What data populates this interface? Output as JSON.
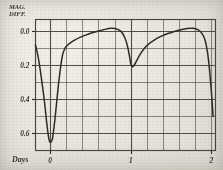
{
  "figure": {
    "kind": "scanned-light-curve-plot",
    "ylabel_line1": "MAG.",
    "ylabel_line2": "DIFF.",
    "xlabel": "Days",
    "ink_color": "#2e2b25",
    "grid_color": "#4a463e",
    "paper_color": "#e9e7e1"
  },
  "chart_data": {
    "type": "line",
    "title": "",
    "xlabel": "Days",
    "ylabel": "MAG. DIFF.",
    "xlim": [
      -0.18,
      2.05
    ],
    "ylim": [
      0.7,
      -0.07
    ],
    "y_inverted": true,
    "grid": true,
    "legend": null,
    "xticks": [
      0,
      1,
      2
    ],
    "xticklabels": [
      "0",
      "1",
      "2"
    ],
    "yticks": [
      0.0,
      0.2,
      0.4,
      0.6
    ],
    "yticklabels": [
      "0.0",
      "0.2",
      "0.4",
      "0.6"
    ],
    "x_minor_step": 0.2,
    "y_minor_step": 0.1,
    "series": [
      {
        "name": "magnitude difference",
        "x": [
          -0.18,
          -0.16,
          -0.14,
          -0.12,
          -0.1,
          -0.08,
          -0.06,
          -0.045,
          -0.03,
          -0.015,
          0.0,
          0.015,
          0.03,
          0.045,
          0.06,
          0.075,
          0.09,
          0.105,
          0.12,
          0.14,
          0.16,
          0.19,
          0.22,
          0.26,
          0.31,
          0.37,
          0.44,
          0.52,
          0.6,
          0.68,
          0.75,
          0.82,
          0.88,
          0.92,
          0.95,
          0.97,
          0.99,
          1.0,
          1.02,
          1.04,
          1.07,
          1.11,
          1.16,
          1.22,
          1.3,
          1.38,
          1.46,
          1.54,
          1.62,
          1.7,
          1.77,
          1.83,
          1.88,
          1.92,
          1.95,
          1.975,
          2.0,
          2.02
        ],
        "y": [
          0.08,
          0.12,
          0.17,
          0.23,
          0.3,
          0.37,
          0.45,
          0.52,
          0.58,
          0.63,
          0.652,
          0.648,
          0.63,
          0.58,
          0.52,
          0.45,
          0.38,
          0.31,
          0.25,
          0.18,
          0.13,
          0.095,
          0.08,
          0.065,
          0.05,
          0.035,
          0.022,
          0.008,
          -0.003,
          -0.012,
          -0.018,
          -0.016,
          0.0,
          0.03,
          0.07,
          0.11,
          0.16,
          0.19,
          0.208,
          0.2,
          0.175,
          0.14,
          0.105,
          0.075,
          0.048,
          0.028,
          0.012,
          0.0,
          -0.01,
          -0.017,
          -0.018,
          -0.01,
          0.01,
          0.05,
          0.12,
          0.22,
          0.36,
          0.5
        ]
      }
    ],
    "annotations": [
      {
        "text": "primary minimum",
        "x": 0.0,
        "y": 0.652
      },
      {
        "text": "secondary minimum",
        "x": 1.0,
        "y": 0.208
      }
    ]
  }
}
